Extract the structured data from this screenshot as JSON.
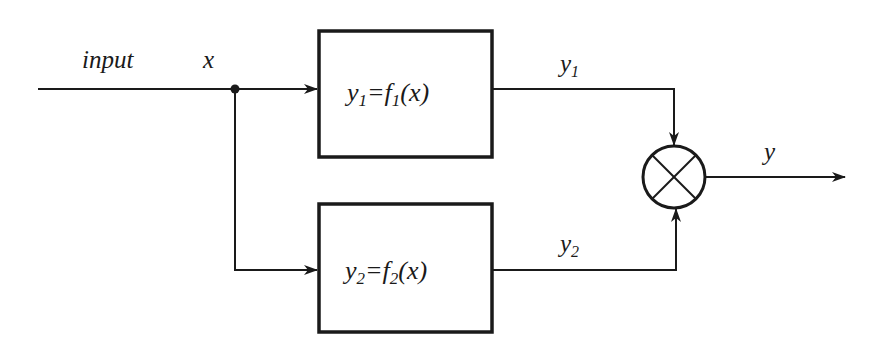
{
  "diagram": {
    "type": "block-diagram",
    "colors": {
      "stroke": "#1a1a1a",
      "background": "#ffffff"
    },
    "labels": {
      "input": "input",
      "x": "x",
      "y1_signal": "y",
      "y1_sub": "1",
      "y2_signal": "y",
      "y2_sub": "2",
      "output": "y"
    },
    "blocks": [
      {
        "id": "f1",
        "eq_y": "y",
        "eq_y_sub": "1",
        "eq_eq": "=",
        "eq_f": "f",
        "eq_f_sub": "1",
        "eq_arg": "(x)"
      },
      {
        "id": "f2",
        "eq_y": "y",
        "eq_y_sub": "2",
        "eq_eq": "=",
        "eq_f": "f",
        "eq_f_sub": "2",
        "eq_arg": "(x)"
      }
    ],
    "combiner": {
      "symbol": "multiplier-circle-x"
    }
  }
}
